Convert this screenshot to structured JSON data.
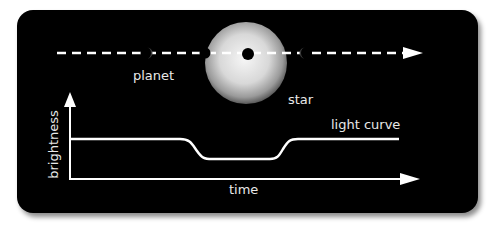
{
  "diagram": {
    "colors": {
      "background": "#000000",
      "foreground": "#ffffff",
      "label_text": "#e8e8e8",
      "star_center": "#f4f4f4",
      "star_edge": "#6a6a6a"
    },
    "labels": {
      "planet": "planet",
      "star": "star",
      "light_curve": "light curve",
      "time": "time",
      "brightness": "brightness"
    },
    "orbit_path": {
      "style": "dashed",
      "direction": "left-to-right",
      "arrow": "arrow-right-icon"
    },
    "planet_positions": [
      {
        "phase": "before-transit",
        "appearance": "faint crescent"
      },
      {
        "phase": "ingress",
        "appearance": "dark disc at star limb"
      },
      {
        "phase": "mid-transit",
        "appearance": "dark disc on star"
      },
      {
        "phase": "after-transit",
        "appearance": "faint crescent"
      }
    ],
    "axes": {
      "x_label": "time",
      "y_label": "brightness"
    },
    "light_curve": {
      "shape": "flat, dip during transit, flat",
      "baseline_level": "high",
      "transit_level": "lower"
    }
  }
}
